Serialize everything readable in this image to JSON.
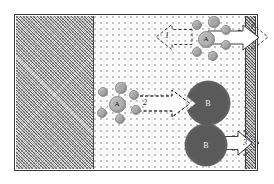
{
  "figure": {
    "type": "schematic-diagram",
    "width": 274,
    "height": 184
  },
  "regions": [
    {
      "id": "solid-phase",
      "name": "left-hatched-region",
      "fill": "cross-hatch",
      "color": "#d8d8d8",
      "x": 16,
      "y": 16,
      "w": 78,
      "h": 153
    },
    {
      "id": "porous-phase",
      "name": "middle-dotted-region",
      "fill": "stipple-dots",
      "color": "#fdfdfd",
      "x": 94,
      "y": 16,
      "w": 151,
      "h": 153
    },
    {
      "id": "membrane-wall",
      "name": "right-hatched-wall",
      "fill": "cross-hatch",
      "color": "#d2d2d2",
      "x": 245,
      "y": 16,
      "w": 11,
      "h": 153
    }
  ],
  "clusters": [
    {
      "id": "cluster-a-top",
      "label": "A",
      "core": {
        "cx": 206,
        "cy": 39,
        "r": 8.5,
        "color": "#b3b3b3"
      },
      "satellites": [
        {
          "cx": 197,
          "cy": 25,
          "r": 5.2
        },
        {
          "cx": 214,
          "cy": 22,
          "r": 5.6
        },
        {
          "cx": 226,
          "cy": 30,
          "r": 5.4
        },
        {
          "cx": 197,
          "cy": 52,
          "r": 5.2
        },
        {
          "cx": 213,
          "cy": 56,
          "r": 5.4
        },
        {
          "cx": 226,
          "cy": 45,
          "r": 5.0
        }
      ],
      "satellite_color": "#a9a9a9"
    },
    {
      "id": "cluster-a-middle",
      "label": "A",
      "core": {
        "cx": 117,
        "cy": 104,
        "r": 8.5,
        "color": "#b3b3b3"
      },
      "satellites": [
        {
          "cx": 103,
          "cy": 92,
          "r": 5.2
        },
        {
          "cx": 121,
          "cy": 88,
          "r": 5.6
        },
        {
          "cx": 134,
          "cy": 95,
          "r": 5.4
        },
        {
          "cx": 102,
          "cy": 113,
          "r": 5.2
        },
        {
          "cx": 120,
          "cy": 119,
          "r": 5.4
        },
        {
          "cx": 136,
          "cy": 110,
          "r": 5.2
        }
      ],
      "satellite_color": "#a9a9a9"
    }
  ],
  "aggregates": [
    {
      "id": "aggregate-b-middle",
      "label": "B",
      "cx": 208,
      "cy": 103,
      "r": 22,
      "color": "#5a5a5a",
      "notched": true
    },
    {
      "id": "aggregate-b-bottom",
      "label": "B",
      "cx": 206,
      "cy": 145,
      "r": 21,
      "color": "#5a5a5a",
      "notched": false
    }
  ],
  "arrows": [
    {
      "id": "arrow-1",
      "number": "1",
      "direction": "left",
      "style": "dashed-outline",
      "label_x": 165,
      "label_y": 36,
      "description": "dashed outline arrow pointing left from cluster A (top)"
    },
    {
      "id": "arrow-1-out",
      "number": "",
      "direction": "right",
      "style": "solid-white-with-dashed-extension",
      "description": "white arrow exiting through membrane wall at top, with dashed arrowhead beyond"
    },
    {
      "id": "arrow-2",
      "number": "2",
      "direction": "right",
      "style": "dashed-outline-white",
      "label_x": 143,
      "label_y": 100,
      "description": "arrow pointing right from cluster A (middle) into aggregate B"
    },
    {
      "id": "arrow-3",
      "number": "3",
      "direction": "right",
      "style": "solid-white-with-dashed-extension",
      "label_x": 243,
      "label_y": 142,
      "description": "white arrow exiting through membrane wall at bottom from aggregate B"
    }
  ],
  "colors": {
    "stroke": "#3a3a3a",
    "hatch_fill": "#d8d8d8",
    "dot_fill": "#fdfdfd",
    "particle_small": "#a9a9a9",
    "particle_core": "#b3b3b3",
    "aggregate": "#5a5a5a",
    "arrow_fill": "#ffffff",
    "arrow_stroke": "#2b2b2b",
    "label_text": "#1a1a1a"
  }
}
